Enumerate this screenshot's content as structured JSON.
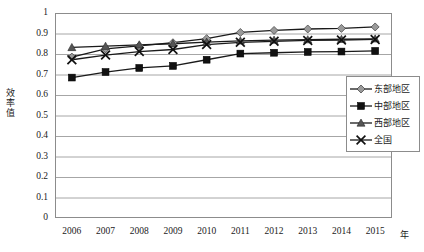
{
  "chart_data": {
    "type": "line",
    "title": "",
    "xlabel": "年",
    "ylabel": "效率值",
    "grid": true,
    "legend_position": "right",
    "xlim": [
      2006,
      2015
    ],
    "ylim": [
      0,
      1
    ],
    "ytick_labels": [
      "1",
      "0.9",
      "0.8",
      "0.7",
      "0.6",
      "0.5",
      "0.4",
      "0.3",
      "0.2",
      "0.1",
      "0"
    ],
    "ytick_values": [
      1,
      0.9,
      0.8,
      0.7,
      0.6,
      0.5,
      0.4,
      0.3,
      0.2,
      0.1,
      0
    ],
    "categories": [
      "2006",
      "2007",
      "2008",
      "2009",
      "2010",
      "2011",
      "2012",
      "2013",
      "2014",
      "2015"
    ],
    "x": [
      2006,
      2007,
      2008,
      2009,
      2010,
      2011,
      2012,
      2013,
      2014,
      2015
    ],
    "series": [
      {
        "name": "东部地区",
        "marker": "diamond",
        "color": "#9a9a9a",
        "line_color": "#1a1a1a",
        "values": [
          0.785,
          0.825,
          0.84,
          0.855,
          0.875,
          0.905,
          0.915,
          0.922,
          0.925,
          0.932
        ]
      },
      {
        "name": "中部地区",
        "marker": "square",
        "color": "#111111",
        "line_color": "#1a1a1a",
        "values": [
          0.685,
          0.712,
          0.732,
          0.742,
          0.772,
          0.802,
          0.806,
          0.81,
          0.812,
          0.815
        ]
      },
      {
        "name": "西部地区",
        "marker": "triangle",
        "color": "#555555",
        "line_color": "#1a1a1a",
        "values": [
          0.832,
          0.838,
          0.845,
          0.85,
          0.858,
          0.864,
          0.868,
          0.87,
          0.872,
          0.874
        ]
      },
      {
        "name": "全国",
        "marker": "cross",
        "color": "#111111",
        "line_color": "#1a1a1a",
        "values": [
          0.772,
          0.795,
          0.812,
          0.822,
          0.846,
          0.857,
          0.862,
          0.866,
          0.868,
          0.871
        ]
      }
    ]
  },
  "legend": {
    "items": [
      {
        "label": "东部地区",
        "marker": "diamond"
      },
      {
        "label": "中部地区",
        "marker": "square"
      },
      {
        "label": "西部地区",
        "marker": "triangle"
      },
      {
        "label": "全国",
        "marker": "cross"
      }
    ]
  },
  "axis": {
    "y_title_chars": [
      "效",
      "率",
      "值"
    ],
    "x_unit": "年"
  },
  "colors": {
    "frame": "#8c8c8c",
    "grid": "#a6a6a6",
    "line": "#1a1a1a",
    "text": "#1a1a1a",
    "background": "#ffffff"
  }
}
